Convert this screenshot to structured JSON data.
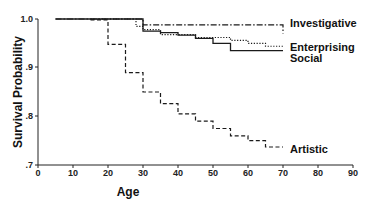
{
  "chart_data": {
    "type": "line",
    "subtype": "step-survival",
    "title": "",
    "xlabel": "Age",
    "ylabel": "Survival Probability",
    "xlim": [
      0,
      90
    ],
    "ylim": [
      0.7,
      1.0
    ],
    "x_ticks": [
      "0",
      "10",
      "20",
      "30",
      "40",
      "50",
      "60",
      "70",
      "80",
      "90"
    ],
    "y_ticks": [
      ".7",
      ".8",
      ".9",
      "1.0"
    ],
    "grid": false,
    "legend_position": "inline-right",
    "series": [
      {
        "name": "Investigative",
        "style": "dash-dot",
        "x": [
          5,
          30,
          70,
          70
        ],
        "y": [
          1.0,
          0.988,
          0.988,
          0.97
        ]
      },
      {
        "name": "Enterprising",
        "style": "dotted",
        "x": [
          15,
          28,
          30,
          35,
          45,
          55,
          60,
          65,
          70
        ],
        "y": [
          1.0,
          0.985,
          0.978,
          0.968,
          0.962,
          0.956,
          0.95,
          0.944,
          0.944
        ]
      },
      {
        "name": "Social",
        "style": "solid",
        "x": [
          5,
          30,
          35,
          40,
          45,
          50,
          55,
          70
        ],
        "y": [
          1.0,
          0.975,
          0.972,
          0.967,
          0.96,
          0.95,
          0.935,
          0.935
        ]
      },
      {
        "name": "Artistic",
        "style": "dashed",
        "x": [
          15,
          20,
          25,
          30,
          35,
          40,
          45,
          50,
          55,
          60,
          65,
          70
        ],
        "y": [
          0.998,
          0.948,
          0.89,
          0.85,
          0.826,
          0.805,
          0.79,
          0.775,
          0.76,
          0.75,
          0.737,
          0.737
        ]
      }
    ]
  },
  "labels": {
    "xlabel": "Age",
    "ylabel": "Survival Probability",
    "investigative": "Investigative",
    "enterprising": "Enterprising",
    "social": "Social",
    "artistic": "Artistic",
    "x0": "0",
    "x10": "10",
    "x20": "20",
    "x30": "30",
    "x40": "40",
    "x50": "50",
    "x60": "60",
    "x70": "70",
    "x80": "80",
    "x90": "90",
    "y7": ".7",
    "y8": ".8",
    "y9": ".9",
    "y10": "1.0"
  }
}
